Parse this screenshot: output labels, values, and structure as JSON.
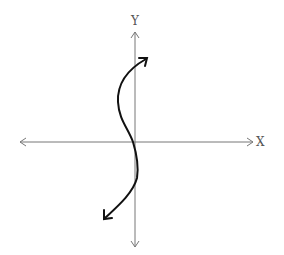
{
  "diagram": {
    "x_axis_label": "X",
    "y_axis_label": "Y",
    "axis_color": "#777777",
    "curve_color": "#111111",
    "curve_description": "S-shaped curve with arrowheads at both ends, passing near the origin"
  }
}
